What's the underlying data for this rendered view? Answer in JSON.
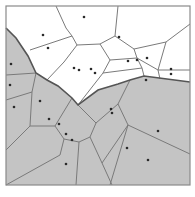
{
  "diagram": {
    "type": "voronoi-partition",
    "frame": {
      "x": 6,
      "y": 6,
      "width": 184,
      "height": 179
    },
    "colors": {
      "shaded": "#c4c4c4",
      "white": "#ffffff",
      "edge": "#7a7a7a",
      "boundary": "#555555",
      "site": "#2a2a2a"
    },
    "shaded_region": [
      [
        6,
        28
      ],
      [
        16,
        38
      ],
      [
        28,
        56
      ],
      [
        36,
        73
      ],
      [
        47,
        80
      ],
      [
        58,
        86
      ],
      [
        72,
        98
      ],
      [
        78,
        105
      ],
      [
        98,
        90
      ],
      [
        118,
        84
      ],
      [
        130,
        80
      ],
      [
        144,
        76
      ],
      [
        190,
        82
      ],
      [
        190,
        185
      ],
      [
        6,
        185
      ]
    ],
    "boundary": [
      [
        6,
        28
      ],
      [
        16,
        38
      ],
      [
        28,
        56
      ],
      [
        36,
        73
      ],
      [
        47,
        80
      ],
      [
        58,
        86
      ],
      [
        72,
        98
      ],
      [
        78,
        105
      ],
      [
        98,
        90
      ],
      [
        118,
        84
      ],
      [
        130,
        80
      ],
      [
        144,
        76
      ],
      [
        190,
        82
      ]
    ],
    "edges": [
      [
        [
          56,
          6
        ],
        [
          66,
          28
        ],
        [
          72,
          36
        ]
      ],
      [
        [
          72,
          36
        ],
        [
          30,
          50
        ]
      ],
      [
        [
          72,
          36
        ],
        [
          77,
          45
        ],
        [
          64,
          62
        ],
        [
          47,
          80
        ]
      ],
      [
        [
          77,
          45
        ],
        [
          100,
          44
        ],
        [
          115,
          36
        ]
      ],
      [
        [
          100,
          44
        ],
        [
          110,
          60
        ],
        [
          103,
          73
        ],
        [
          78,
          105
        ]
      ],
      [
        [
          115,
          36
        ],
        [
          118,
          6
        ]
      ],
      [
        [
          115,
          36
        ],
        [
          134,
          49
        ],
        [
          166,
          42
        ],
        [
          190,
          24
        ]
      ],
      [
        [
          134,
          49
        ],
        [
          137,
          58
        ],
        [
          142,
          68
        ]
      ],
      [
        [
          110,
          60
        ],
        [
          137,
          58
        ]
      ],
      [
        [
          137,
          58
        ],
        [
          158,
          70
        ],
        [
          190,
          70
        ]
      ],
      [
        [
          158,
          70
        ],
        [
          166,
          42
        ]
      ],
      [
        [
          103,
          73
        ],
        [
          142,
          68
        ]
      ],
      [
        [
          142,
          68
        ],
        [
          144,
          76
        ]
      ],
      [
        [
          158,
          70
        ],
        [
          160,
          79
        ]
      ],
      [
        [
          6,
          75
        ],
        [
          36,
          73
        ]
      ],
      [
        [
          6,
          100
        ],
        [
          32,
          92
        ],
        [
          36,
          73
        ]
      ],
      [
        [
          32,
          92
        ],
        [
          30,
          126
        ],
        [
          6,
          150
        ]
      ],
      [
        [
          30,
          126
        ],
        [
          55,
          126
        ],
        [
          72,
          98
        ]
      ],
      [
        [
          55,
          126
        ],
        [
          64,
          139
        ],
        [
          60,
          155
        ],
        [
          6,
          185
        ]
      ],
      [
        [
          64,
          139
        ],
        [
          79,
          142
        ],
        [
          90,
          137
        ],
        [
          96,
          123
        ]
      ],
      [
        [
          79,
          142
        ],
        [
          76,
          185
        ]
      ],
      [
        [
          96,
          123
        ],
        [
          78,
          105
        ]
      ],
      [
        [
          96,
          123
        ],
        [
          118,
          104
        ],
        [
          130,
          80
        ]
      ],
      [
        [
          90,
          137
        ],
        [
          102,
          163
        ],
        [
          112,
          185
        ]
      ],
      [
        [
          118,
          104
        ],
        [
          128,
          125
        ],
        [
          160,
          140
        ],
        [
          190,
          154
        ]
      ],
      [
        [
          128,
          125
        ],
        [
          102,
          163
        ]
      ],
      [
        [
          128,
          125
        ],
        [
          110,
          185
        ]
      ]
    ],
    "sites": [
      [
        43,
        35
      ],
      [
        84,
        17
      ],
      [
        48,
        48
      ],
      [
        11,
        64
      ],
      [
        74,
        68
      ],
      [
        79,
        70
      ],
      [
        91,
        69
      ],
      [
        95,
        73
      ],
      [
        119,
        37
      ],
      [
        128,
        61
      ],
      [
        137,
        60
      ],
      [
        147,
        58
      ],
      [
        171,
        69
      ],
      [
        171,
        74
      ],
      [
        146,
        80
      ],
      [
        10,
        85
      ],
      [
        40,
        101
      ],
      [
        14,
        107
      ],
      [
        49,
        119
      ],
      [
        59,
        124
      ],
      [
        66,
        134
      ],
      [
        72,
        140
      ],
      [
        66,
        164
      ],
      [
        111,
        109
      ],
      [
        112,
        113
      ],
      [
        158,
        131
      ],
      [
        127,
        148
      ],
      [
        148,
        160
      ]
    ]
  }
}
